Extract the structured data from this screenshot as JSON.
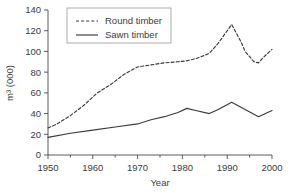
{
  "chart_data": {
    "type": "line",
    "title": "",
    "xlabel": "Year",
    "ylabel": "m³ (000)",
    "xlim": [
      1950,
      2000
    ],
    "ylim": [
      0,
      140
    ],
    "xticks": [
      1950,
      1960,
      1970,
      1980,
      1990,
      2000
    ],
    "xtick_labels": [
      "1950",
      "1960",
      "1970",
      "1980",
      "1990",
      "2000"
    ],
    "yticks": [
      0,
      20,
      40,
      60,
      80,
      100,
      120,
      140
    ],
    "ytick_labels": [
      "0",
      "20",
      "40",
      "60",
      "80",
      "100",
      "120",
      "140"
    ],
    "grid": false,
    "legend_position": "top-left-inside",
    "series": [
      {
        "name": "Round timber",
        "style": "dashed",
        "color": "#3a3a3a",
        "x": [
          1950,
          1952,
          1955,
          1958,
          1961,
          1964,
          1967,
          1970,
          1973,
          1976,
          1979,
          1981,
          1983,
          1986,
          1988,
          1991,
          1993,
          1994,
          1996,
          1997,
          1998,
          2000
        ],
        "values": [
          26,
          30,
          38,
          48,
          60,
          68,
          78,
          85,
          87,
          89,
          90,
          91,
          93,
          98,
          108,
          126,
          110,
          100,
          90,
          89,
          94,
          102
        ]
      },
      {
        "name": "Sawn timber",
        "style": "solid",
        "color": "#3a3a3a",
        "x": [
          1950,
          1955,
          1960,
          1965,
          1970,
          1973,
          1976,
          1979,
          1981,
          1983,
          1986,
          1988,
          1991,
          1994,
          1997,
          2000
        ],
        "values": [
          17,
          21,
          24,
          27,
          30,
          34,
          37,
          41,
          45,
          43,
          40,
          44,
          51,
          44,
          37,
          43
        ]
      }
    ]
  },
  "legend": {
    "items": [
      {
        "label": "Round timber",
        "style": "dashed"
      },
      {
        "label": "Sawn timber",
        "style": "solid"
      }
    ]
  }
}
